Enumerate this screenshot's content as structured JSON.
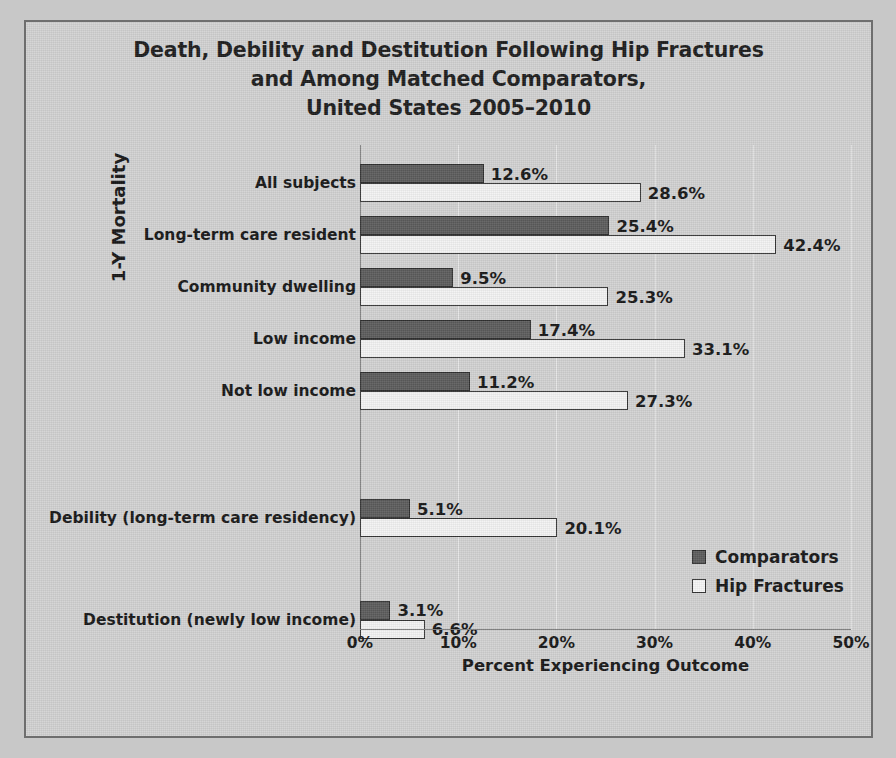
{
  "chart_data": {
    "type": "bar",
    "orientation": "horizontal",
    "title": "Death, Debility and Destitution Following Hip Fractures and Among Matched Comparators, United States 2005–2010",
    "title_lines": [
      "Death, Debility and Destitution Following Hip Fractures",
      "and Among Matched Comparators,",
      "United States 2005–2010"
    ],
    "xlabel": "Percent Experiencing Outcome",
    "ylabel": "1-Y Mortality",
    "xlim": [
      0,
      50
    ],
    "xticks": [
      0,
      10,
      20,
      30,
      40,
      50
    ],
    "xtick_labels": [
      "0%",
      "10%",
      "20%",
      "30%",
      "40%",
      "50%"
    ],
    "grid": true,
    "legend_position": "right-inside",
    "categories": [
      "All subjects",
      "Long-term care resident",
      "Community dwelling",
      "Low income",
      "Not low income",
      "Debility (long-term care residency)",
      "Destitution (newly low income)"
    ],
    "series": [
      {
        "name": "Comparators",
        "color": "#5c5c5c",
        "values": [
          12.6,
          25.4,
          9.5,
          17.4,
          11.2,
          5.1,
          3.1
        ],
        "value_labels": [
          "12.6%",
          "25.4%",
          "9.5%",
          "17.4%",
          "11.2%",
          "5.1%",
          "3.1%"
        ]
      },
      {
        "name": "Hip Fractures",
        "color": "#f3f3f3",
        "values": [
          28.6,
          42.4,
          25.3,
          33.1,
          27.3,
          20.1,
          6.6
        ],
        "value_labels": [
          "28.6%",
          "42.4%",
          "25.3%",
          "33.1%",
          "27.3%",
          "20.1%",
          "6.6%"
        ]
      }
    ]
  },
  "legend": {
    "items": [
      {
        "label": "Comparators",
        "swatch": "comparators"
      },
      {
        "label": "Hip Fractures",
        "swatch": "hip"
      }
    ]
  },
  "colors": {
    "background": "#d2d2d2",
    "frame_border": "#6e6e6e",
    "comparators_bar": "#5c5c5c",
    "hip_fractures_bar": "#f3f3f3",
    "bar_outline": "#333333",
    "text": "#161616",
    "gridline": "#e6e6e6"
  }
}
